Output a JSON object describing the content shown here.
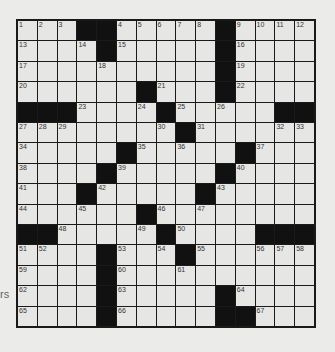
{
  "puzzle": {
    "rows": 15,
    "cols": 15,
    "grid": [
      [
        "1",
        "2",
        "3",
        "#",
        "#",
        "4",
        "5",
        "6",
        "7",
        "8",
        "#",
        "9",
        "10",
        "11",
        "12"
      ],
      [
        "13",
        "",
        "",
        "14",
        "#",
        "15",
        "",
        "",
        "",
        "",
        "#",
        "16",
        "",
        "",
        ""
      ],
      [
        "17",
        "",
        "",
        "",
        "18",
        "",
        "",
        "",
        "",
        "",
        "#",
        "19",
        "",
        "",
        ""
      ],
      [
        "20",
        "",
        "",
        "",
        "",
        "",
        "#",
        "21",
        "",
        "",
        "#",
        "22",
        "",
        "",
        ""
      ],
      [
        "#",
        "#",
        "#",
        "23",
        "",
        "",
        "24",
        "#",
        "25",
        "",
        "26",
        "",
        "",
        "#",
        "#"
      ],
      [
        "27",
        "28",
        "29",
        "",
        "",
        "",
        "",
        "30",
        "#",
        "31",
        "",
        "",
        "",
        "32",
        "33"
      ],
      [
        "34",
        "",
        "",
        "",
        "",
        "#",
        "35",
        "",
        "36",
        "",
        "",
        "#",
        "37",
        "",
        ""
      ],
      [
        "38",
        "",
        "",
        "",
        "#",
        "39",
        "",
        "",
        "",
        "",
        "#",
        "40",
        "",
        "",
        ""
      ],
      [
        "41",
        "",
        "",
        "#",
        "42",
        "",
        "",
        "",
        "",
        "#",
        "43",
        "",
        "",
        "",
        ""
      ],
      [
        "44",
        "",
        "",
        "45",
        "",
        "",
        "#",
        "46",
        "",
        "47",
        "",
        "",
        "",
        "",
        ""
      ],
      [
        "#",
        "#",
        "48",
        "",
        "",
        "",
        "49",
        "#",
        "50",
        "",
        "",
        "",
        "#",
        "#",
        "#"
      ],
      [
        "51",
        "52",
        "",
        "",
        "#",
        "53",
        "",
        "54",
        "#",
        "55",
        "",
        "",
        "56",
        "57",
        "58"
      ],
      [
        "59",
        "",
        "",
        "",
        "#",
        "60",
        "",
        "",
        "61",
        "",
        "",
        "",
        "",
        "",
        ""
      ],
      [
        "62",
        "",
        "",
        "",
        "#",
        "63",
        "",
        "",
        "",
        "",
        "#",
        "64",
        "",
        "",
        ""
      ],
      [
        "65",
        "",
        "",
        "",
        "#",
        "66",
        "",
        "",
        "",
        "",
        "#",
        "#",
        "67",
        "",
        ""
      ]
    ]
  },
  "side_text": "rs"
}
